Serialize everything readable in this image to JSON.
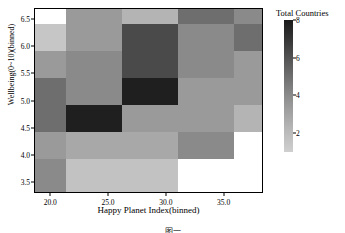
{
  "chart_data": {
    "type": "heatmap",
    "title": "",
    "xlabel": "Happy Planet Index(binned)",
    "ylabel": "Wellbeing(0~10)(binned)",
    "legend_title": "Total Countries",
    "legend_position": "right",
    "colormap": "greys_reversed",
    "grid": false,
    "xlim": [
      18.6,
      38.4
    ],
    "ylim": [
      3.3,
      6.7
    ],
    "xticks": [
      "20.0",
      "25.0",
      "30.0",
      "35.0"
    ],
    "xtick_values": [
      20.0,
      25.0,
      30.0,
      35.0
    ],
    "yticks": [
      "6.5",
      "6.0",
      "5.5",
      "5.0",
      "4.5",
      "4.0",
      "3.5"
    ],
    "ytick_values": [
      6.5,
      6.0,
      5.5,
      5.0,
      4.5,
      4.0,
      3.5
    ],
    "colorbar_ticks": [
      "8",
      "6",
      "4",
      "2"
    ],
    "colorbar_tick_values": [
      8,
      6,
      4,
      2
    ],
    "vmin": 1,
    "vmax": 8,
    "x_bin_edges": [
      18.6,
      21.3,
      26.2,
      31.1,
      36.0,
      38.4
    ],
    "x_categories": [
      "18.6-21.3",
      "21.3-26.2",
      "26.2-31.1",
      "31.1-36.0",
      "36.0-38.4"
    ],
    "y_bin_edges": [
      6.7,
      6.42,
      5.92,
      5.42,
      4.92,
      4.42,
      3.92,
      3.3
    ],
    "y_categories": [
      "6.42-6.70",
      "5.92-6.42",
      "5.42-5.92",
      "4.92-5.42",
      "4.42-4.92",
      "3.92-4.42",
      "3.30-3.92"
    ],
    "values": [
      [
        null,
        3,
        2,
        5,
        4
      ],
      [
        2,
        3,
        6,
        4,
        5
      ],
      [
        3,
        4,
        6,
        4,
        3
      ],
      [
        5,
        4,
        8,
        3,
        3
      ],
      [
        5,
        8,
        3,
        3,
        2
      ],
      [
        3,
        3,
        3,
        3,
        null
      ],
      [
        4,
        2,
        2,
        null,
        null
      ]
    ],
    "colors": [
      [
        "#ffffff",
        "#9a9a9a",
        "#b4b4b4",
        "#6e6e6e",
        "#8a8a8a"
      ],
      [
        "#c6c6c6",
        "#9a9a9a",
        "#4a4a4a",
        "#8a8a8a",
        "#6e6e6e"
      ],
      [
        "#9a9a9a",
        "#8a8a8a",
        "#4a4a4a",
        "#8a8a8a",
        "#9a9a9a"
      ],
      [
        "#6e6e6e",
        "#8a8a8a",
        "#1f1f1f",
        "#9a9a9a",
        "#9a9a9a"
      ],
      [
        "#6e6e6e",
        "#1f1f1f",
        "#9a9a9a",
        "#9a9a9a",
        "#b4b4b4"
      ],
      [
        "#9a9a9a",
        "#a8a8a8",
        "#a8a8a8",
        "#8a8a8a",
        "#ffffff"
      ],
      [
        "#8a8a8a",
        "#c2c2c2",
        "#c2c2c2",
        "#ffffff",
        "#ffffff"
      ]
    ],
    "colorbar_gradient": [
      "#1a1a1a",
      "#3a3a3a",
      "#5c5c5c",
      "#7d7d7d",
      "#9c9c9c",
      "#b8b8b8",
      "#cfcfcf"
    ]
  },
  "caption": {
    "text": "图一"
  }
}
